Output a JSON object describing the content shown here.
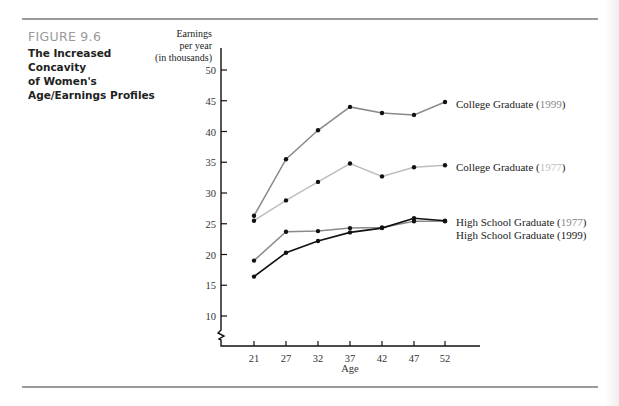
{
  "figure": {
    "label": "FIGURE 9.6",
    "title_lines": [
      "The Increased",
      "Concavity",
      "of Women's",
      "Age/Earnings Profiles"
    ]
  },
  "chart_data": {
    "type": "line",
    "title": "The Increased Concavity of Women's Age/Earnings Profiles",
    "xlabel": "Age",
    "ylabel": "Earnings per year (in thousands)",
    "ylabel_lines": [
      "Earnings",
      "per year",
      "(in thousands)"
    ],
    "x": [
      21,
      27,
      32,
      37,
      42,
      47,
      52
    ],
    "y_ticks": [
      10,
      15,
      20,
      25,
      30,
      35,
      40,
      45,
      50
    ],
    "ylim": [
      5,
      50
    ],
    "axis_break": true,
    "grid": false,
    "legend_position": "inline-right",
    "series": [
      {
        "name": "College Graduate",
        "year": "1999",
        "color": "#8a8a8a",
        "year_color": "#8a8a8a",
        "values": [
          26.3,
          35.5,
          40.2,
          44.0,
          43.0,
          42.7,
          44.8
        ]
      },
      {
        "name": "College Graduate",
        "year": "1977",
        "color": "#bdbdbd",
        "year_color": "#c0c0c0",
        "values": [
          25.5,
          28.8,
          31.8,
          34.8,
          32.7,
          34.2,
          34.5
        ]
      },
      {
        "name": "High School Graduate",
        "year": "1977",
        "color": "#8a8a8a",
        "year_color": "#8a8a8a",
        "values": [
          19.0,
          23.7,
          23.8,
          24.3,
          24.4,
          25.4,
          25.4
        ]
      },
      {
        "name": "High School Graduate",
        "year": "1999",
        "color": "#111111",
        "year_color": "#222222",
        "values": [
          16.4,
          20.3,
          22.2,
          23.6,
          24.3,
          25.9,
          25.5
        ]
      }
    ]
  }
}
